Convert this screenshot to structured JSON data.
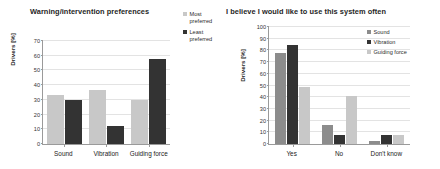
{
  "figure": {
    "background": "#ffffff",
    "colors": {
      "light_gray": "#c8c8c8",
      "medium_gray": "#8c8c8c",
      "dark_gray": "#333333",
      "grid": "#e3e3e3",
      "axis": "#9a9a9a"
    }
  },
  "chart_data": [
    {
      "type": "bar",
      "id": "warning-intervention-preferences",
      "title": "Warning/intervention preferences",
      "xlabel": "",
      "ylabel": "Drivers [%]",
      "categories": [
        "Sound",
        "Vibration",
        "Guiding force"
      ],
      "ylim": [
        0,
        70
      ],
      "yticks": [
        0,
        10,
        20,
        30,
        40,
        50,
        60,
        70
      ],
      "ytick_labels": [
        "0",
        "10",
        "20",
        "30",
        "40",
        "50",
        "60",
        "70"
      ],
      "grid": true,
      "legend_position": "right",
      "series": [
        {
          "name": "Most preferred",
          "color": "#c8c8c8",
          "values": [
            33,
            37,
            30
          ]
        },
        {
          "name": "Least preferred",
          "color": "#333333",
          "values": [
            30,
            12,
            58
          ]
        }
      ]
    },
    {
      "type": "bar",
      "id": "system-use-often",
      "title": "I believe I would like to use this system often",
      "xlabel": "",
      "ylabel": "Drivers [%]",
      "categories": [
        "Yes",
        "No",
        "Don't know"
      ],
      "ylim": [
        0,
        100
      ],
      "yticks": [
        0,
        10,
        20,
        30,
        40,
        50,
        60,
        70,
        80,
        90,
        100
      ],
      "ytick_labels": [
        "0",
        "10",
        "20",
        "30",
        "40",
        "50",
        "60",
        "70",
        "80",
        "90",
        "100"
      ],
      "grid": true,
      "legend_position": "top-right",
      "series": [
        {
          "name": "Sound",
          "color": "#8c8c8c",
          "values": [
            78,
            16,
            3
          ]
        },
        {
          "name": "Vibration",
          "color": "#333333",
          "values": [
            85,
            8,
            8
          ]
        },
        {
          "name": "Guiding force",
          "color": "#c8c8c8",
          "values": [
            49,
            41,
            8
          ]
        }
      ]
    }
  ]
}
